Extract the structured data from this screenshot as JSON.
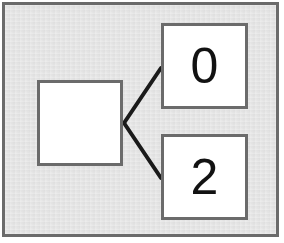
{
  "diagram": {
    "background_color": "#e3e3e3",
    "frame_color": "#6b6b6b",
    "node_fill": "#ffffff",
    "node_border_color": "#6b6b6b",
    "edge_color": "#1a1a1a",
    "nodes": [
      {
        "id": "root",
        "label": "",
        "x": 37,
        "y": 80,
        "w": 86,
        "h": 86
      },
      {
        "id": "child-0",
        "label": "0",
        "x": 161,
        "y": 23,
        "w": 87,
        "h": 86
      },
      {
        "id": "child-1",
        "label": "2",
        "x": 161,
        "y": 134,
        "w": 87,
        "h": 86
      }
    ],
    "edges": [
      {
        "from": "root",
        "to": "child-0",
        "x1": 124,
        "y1": 123,
        "x2": 161,
        "y2": 68
      },
      {
        "from": "root",
        "to": "child-1",
        "x1": 124,
        "y1": 123,
        "x2": 161,
        "y2": 178
      }
    ]
  }
}
